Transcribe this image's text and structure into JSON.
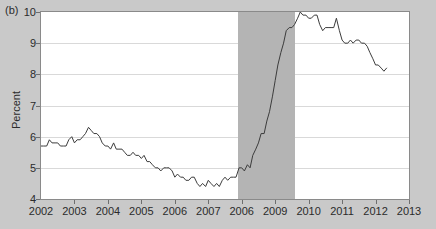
{
  "panel": {
    "label": "(b)"
  },
  "chart_data": {
    "type": "line",
    "title": "",
    "xlabel": "",
    "ylabel": "Percent",
    "ylim": [
      4,
      10
    ],
    "yticks": [
      4,
      5,
      6,
      7,
      8,
      9,
      10
    ],
    "ytick_labels": [
      "4",
      "5",
      "6",
      "7",
      "8",
      "9",
      "10"
    ],
    "xlim": [
      2002,
      2013
    ],
    "xticks": [
      2002,
      2003,
      2004,
      2005,
      2006,
      2007,
      2008,
      2009,
      2010,
      2011,
      2012,
      2013
    ],
    "xtick_labels": [
      "2002",
      "2003",
      "2004",
      "2005",
      "2006",
      "2007",
      "2006",
      "2009",
      "2010",
      "2011",
      "2012",
      "2013"
    ],
    "grid": true,
    "legend": "none",
    "line_color": "#3c3c3c",
    "shaded_region": {
      "label": "recession",
      "color": "#b4b4b4",
      "x_start": 2007.9,
      "x_end": 2009.6
    },
    "series": [
      {
        "name": "Percent",
        "x": [
          2002.0,
          2002.08,
          2002.17,
          2002.25,
          2002.33,
          2002.42,
          2002.5,
          2002.58,
          2002.67,
          2002.75,
          2002.83,
          2002.92,
          2003.0,
          2003.08,
          2003.17,
          2003.25,
          2003.33,
          2003.42,
          2003.5,
          2003.58,
          2003.67,
          2003.75,
          2003.83,
          2003.92,
          2004.0,
          2004.08,
          2004.17,
          2004.25,
          2004.33,
          2004.42,
          2004.5,
          2004.58,
          2004.67,
          2004.75,
          2004.83,
          2004.92,
          2005.0,
          2005.08,
          2005.17,
          2005.25,
          2005.33,
          2005.42,
          2005.5,
          2005.58,
          2005.67,
          2005.75,
          2005.83,
          2005.92,
          2006.0,
          2006.08,
          2006.17,
          2006.25,
          2006.33,
          2006.42,
          2006.5,
          2006.58,
          2006.67,
          2006.75,
          2006.83,
          2006.92,
          2007.0,
          2007.08,
          2007.17,
          2007.25,
          2007.33,
          2007.42,
          2007.5,
          2007.58,
          2007.67,
          2007.75,
          2007.83,
          2007.92,
          2008.0,
          2008.08,
          2008.17,
          2008.25,
          2008.33,
          2008.42,
          2008.5,
          2008.58,
          2008.67,
          2008.75,
          2008.83,
          2008.92,
          2009.0,
          2009.08,
          2009.17,
          2009.25,
          2009.33,
          2009.42,
          2009.5,
          2009.58,
          2009.67,
          2009.75,
          2009.83,
          2009.92,
          2010.0,
          2010.08,
          2010.17,
          2010.25,
          2010.33,
          2010.42,
          2010.5,
          2010.58,
          2010.67,
          2010.75,
          2010.83,
          2010.92,
          2011.0,
          2011.08,
          2011.17,
          2011.25,
          2011.33,
          2011.42,
          2011.5,
          2011.58,
          2011.67,
          2011.75,
          2011.83,
          2011.92,
          2012.0,
          2012.08,
          2012.17,
          2012.25,
          2012.33
        ],
        "values": [
          5.7,
          5.7,
          5.7,
          5.9,
          5.8,
          5.8,
          5.8,
          5.7,
          5.7,
          5.7,
          5.9,
          6.0,
          5.8,
          5.9,
          5.9,
          6.0,
          6.1,
          6.3,
          6.2,
          6.1,
          6.1,
          6.0,
          5.8,
          5.7,
          5.7,
          5.6,
          5.8,
          5.6,
          5.6,
          5.6,
          5.5,
          5.4,
          5.4,
          5.5,
          5.4,
          5.4,
          5.3,
          5.4,
          5.2,
          5.2,
          5.1,
          5.0,
          5.0,
          4.9,
          5.0,
          5.0,
          5.0,
          4.9,
          4.7,
          4.8,
          4.7,
          4.7,
          4.6,
          4.6,
          4.7,
          4.7,
          4.5,
          4.4,
          4.5,
          4.4,
          4.6,
          4.5,
          4.4,
          4.5,
          4.4,
          4.6,
          4.7,
          4.6,
          4.7,
          4.7,
          4.7,
          5.0,
          5.0,
          4.9,
          5.1,
          5.0,
          5.4,
          5.6,
          5.8,
          6.1,
          6.1,
          6.5,
          6.8,
          7.3,
          7.8,
          8.3,
          8.7,
          9.0,
          9.4,
          9.5,
          9.5,
          9.6,
          9.8,
          10.0,
          9.9,
          9.9,
          9.8,
          9.8,
          9.9,
          9.9,
          9.6,
          9.4,
          9.5,
          9.5,
          9.5,
          9.5,
          9.8,
          9.4,
          9.1,
          9.0,
          9.0,
          9.1,
          9.0,
          9.1,
          9.1,
          9.0,
          9.0,
          8.9,
          8.7,
          8.5,
          8.3,
          8.3,
          8.2,
          8.1,
          8.2
        ]
      }
    ]
  }
}
